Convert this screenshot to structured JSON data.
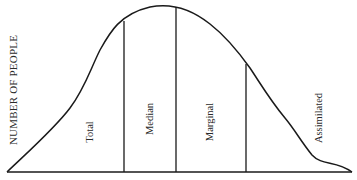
{
  "diagram": {
    "type": "bell-curve-segmented",
    "y_axis_label": "NUMBER OF PEOPLE",
    "segments": [
      {
        "label": "Total"
      },
      {
        "label": "Median"
      },
      {
        "label": "Marginal"
      },
      {
        "label": "Assimilated"
      }
    ],
    "colors": {
      "line": "#1a1a1a",
      "text": "#2a2a2a",
      "background": "#ffffff"
    }
  }
}
